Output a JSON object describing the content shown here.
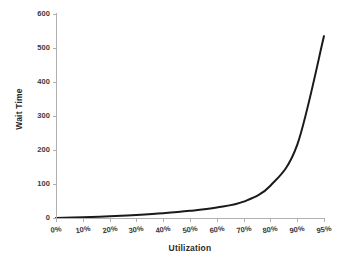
{
  "chart_data": {
    "type": "line",
    "title": "",
    "xlabel": "Utilization",
    "ylabel": "Wait Time",
    "categories": [
      "0%",
      "10%",
      "20%",
      "30%",
      "40%",
      "50%",
      "60%",
      "70%",
      "80%",
      "90%",
      "95%"
    ],
    "x_numeric": [
      0,
      10,
      20,
      30,
      40,
      50,
      60,
      70,
      80,
      90,
      95
    ],
    "values": [
      0,
      2,
      5,
      9,
      14,
      21,
      31,
      48,
      95,
      215,
      535
    ],
    "series": [
      {
        "name": "Wait Time",
        "values": [
          0,
          2,
          5,
          9,
          14,
          21,
          31,
          48,
          95,
          215,
          535
        ],
        "color": "#1a1a1a",
        "line_width": 2
      }
    ],
    "ylim": [
      0,
      600
    ],
    "y_ticks": [
      0,
      100,
      200,
      300,
      400,
      500,
      600
    ],
    "y_tick_labels": [
      "0",
      "100",
      "200",
      "300",
      "400",
      "500",
      "600"
    ],
    "grid": false,
    "legend": false,
    "legend_position": "none",
    "x_tick_label_rotation": -9,
    "axis_color": "#b0b0b0",
    "background_color": "#ffffff",
    "tick_label_color": "#3a3a3a",
    "axis_title_color": "#2b2b2b"
  },
  "axes": {
    "x_title": "Utilization",
    "y_title": "Wait Time"
  }
}
